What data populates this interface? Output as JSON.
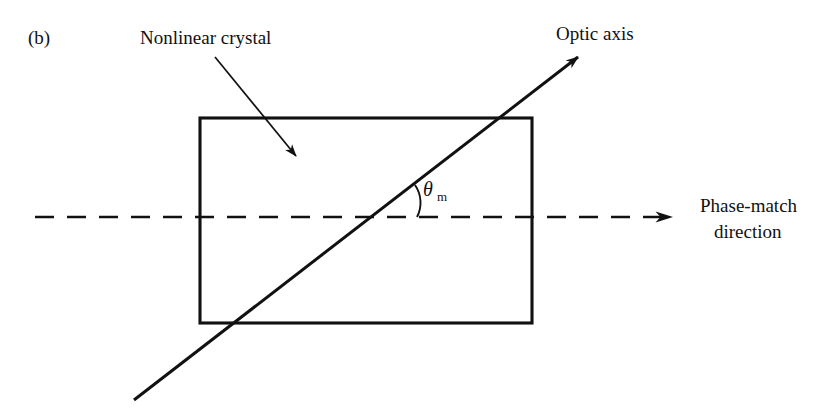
{
  "figure": {
    "panel_label": "(b)",
    "background_color": "#ffffff",
    "ink_color": "#111111",
    "width": 835,
    "height": 420
  },
  "labels": {
    "crystal": "Nonlinear crystal",
    "optic_axis": "Optic axis",
    "phase_match_line1": "Phase-match",
    "phase_match_line2": "direction",
    "angle_symbol": "θ",
    "angle_subscript": "m"
  },
  "geometry": {
    "crystal_rect": {
      "x": 200,
      "y": 118,
      "width": 332,
      "height": 205
    },
    "dashed_axis": {
      "x1": 35,
      "y1": 217,
      "x2": 672,
      "y2": 217
    },
    "dashed_arrow_tip_x": 690,
    "optic_axis_ray": {
      "x1": 134,
      "y1": 400,
      "x2": 578,
      "y2": 57
    },
    "optic_arrow_tip": {
      "x": 592,
      "y": 47
    },
    "intersection": {
      "x": 392,
      "y": 217
    },
    "angle_degrees": 37.7,
    "crystal_leader": {
      "x1": 215,
      "y1": 57,
      "x2": 296,
      "y2": 156
    },
    "crystal_leader_tip": {
      "x": 306,
      "y": 168
    }
  },
  "text_positions": {
    "panel_label": {
      "x": 28,
      "y": 44
    },
    "crystal": {
      "x": 140,
      "y": 44
    },
    "optic_axis": {
      "x": 556,
      "y": 40
    },
    "phase_match_line1": {
      "x": 700,
      "y": 212
    },
    "phase_match_line2": {
      "x": 714,
      "y": 238
    },
    "angle_symbol": {
      "x": 423,
      "y": 196
    },
    "angle_subscript": {
      "x": 437,
      "y": 201
    }
  }
}
